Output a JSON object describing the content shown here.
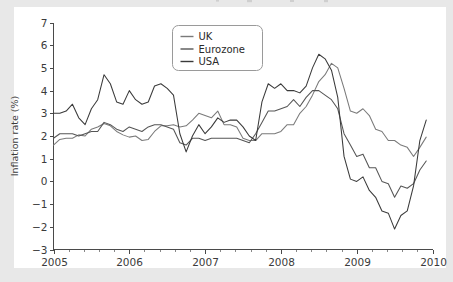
{
  "figure": {
    "background_outer": "#e8e8e8",
    "background_card": "#ffffff",
    "axis_color": "#4a4a4a",
    "text_color": "#3b3b3b"
  },
  "axes": {
    "y_title": "Inflation rate (%)",
    "x_title": "",
    "y_ticks": [
      "7",
      "6",
      "5",
      "4",
      "3",
      "2",
      "1",
      "0",
      "-1",
      "-2",
      "-3"
    ],
    "x_ticks": [
      "2005",
      "2006",
      "2007",
      "2008",
      "2009",
      "2010"
    ]
  },
  "legend": {
    "position": "upper-center",
    "entries": [
      {
        "label": "UK",
        "color": "#7a7a7a"
      },
      {
        "label": "Eurozone",
        "color": "#555555"
      },
      {
        "label": "USA",
        "color": "#3a3a3a"
      }
    ]
  },
  "chart_data": {
    "type": "line",
    "title": "",
    "xlabel": "",
    "ylabel": "Inflation rate (%)",
    "xlim": [
      2005.0,
      2010.0
    ],
    "ylim": [
      -3,
      7
    ],
    "y_ticks": [
      7,
      6,
      5,
      4,
      3,
      2,
      1,
      0,
      -1,
      -2,
      -3
    ],
    "x_ticks": [
      2005,
      2006,
      2007,
      2008,
      2009,
      2010
    ],
    "x_minor_ticks_per_interval": 4,
    "grid": false,
    "legend_position": "upper center",
    "x_unit": "year (monthly samples)",
    "x": [
      2005.0,
      2005.083,
      2005.167,
      2005.25,
      2005.333,
      2005.417,
      2005.5,
      2005.583,
      2005.667,
      2005.75,
      2005.833,
      2005.917,
      2006.0,
      2006.083,
      2006.167,
      2006.25,
      2006.333,
      2006.417,
      2006.5,
      2006.583,
      2006.667,
      2006.75,
      2006.833,
      2006.917,
      2007.0,
      2007.083,
      2007.167,
      2007.25,
      2007.333,
      2007.417,
      2007.5,
      2007.583,
      2007.667,
      2007.75,
      2007.833,
      2007.917,
      2008.0,
      2008.083,
      2008.167,
      2008.25,
      2008.333,
      2008.417,
      2008.5,
      2008.583,
      2008.667,
      2008.75,
      2008.833,
      2008.917,
      2009.0,
      2009.083,
      2009.167,
      2009.25,
      2009.333,
      2009.417,
      2009.5,
      2009.583,
      2009.667,
      2009.75,
      2009.833,
      2009.917
    ],
    "series": [
      {
        "name": "UK",
        "color": "#7a7a7a",
        "values": [
          1.6,
          1.85,
          1.9,
          1.9,
          2.05,
          2.0,
          2.3,
          2.4,
          2.55,
          2.45,
          2.2,
          2.05,
          1.95,
          2.0,
          1.8,
          1.85,
          2.2,
          2.45,
          2.45,
          2.5,
          2.4,
          2.45,
          2.7,
          3.0,
          2.9,
          2.8,
          3.1,
          2.5,
          2.5,
          2.4,
          1.9,
          1.8,
          1.8,
          2.1,
          2.1,
          2.1,
          2.2,
          2.5,
          2.5,
          3.0,
          3.3,
          3.8,
          4.4,
          4.7,
          5.2,
          5.0,
          4.1,
          3.1,
          3.0,
          3.2,
          2.9,
          2.3,
          2.2,
          1.8,
          1.8,
          1.6,
          1.5,
          1.1,
          1.5,
          1.95
        ]
      },
      {
        "name": "Eurozone",
        "color": "#555555",
        "values": [
          1.9,
          2.1,
          2.1,
          2.1,
          2.0,
          2.1,
          2.2,
          2.2,
          2.6,
          2.5,
          2.3,
          2.2,
          2.4,
          2.3,
          2.2,
          2.4,
          2.5,
          2.5,
          2.4,
          2.3,
          1.7,
          1.6,
          1.9,
          1.9,
          1.8,
          1.9,
          1.9,
          1.9,
          1.9,
          1.9,
          1.8,
          1.7,
          2.1,
          2.6,
          3.1,
          3.1,
          3.2,
          3.3,
          3.6,
          3.3,
          3.7,
          4.0,
          4.0,
          3.8,
          3.6,
          3.2,
          2.1,
          1.6,
          1.1,
          1.2,
          0.6,
          0.6,
          0.0,
          -0.1,
          -0.7,
          -0.2,
          -0.3,
          -0.1,
          0.5,
          0.9
        ]
      },
      {
        "name": "USA",
        "color": "#3a3a3a",
        "values": [
          3.0,
          3.0,
          3.1,
          3.4,
          2.8,
          2.5,
          3.2,
          3.6,
          4.7,
          4.3,
          3.5,
          3.4,
          4.0,
          3.6,
          3.4,
          3.5,
          4.2,
          4.3,
          4.1,
          3.8,
          2.1,
          1.3,
          2.0,
          2.5,
          2.1,
          2.4,
          2.8,
          2.6,
          2.7,
          2.7,
          2.4,
          2.0,
          1.8,
          3.5,
          4.3,
          4.1,
          4.3,
          4.0,
          4.0,
          3.9,
          4.2,
          5.0,
          5.6,
          5.4,
          4.9,
          3.7,
          1.1,
          0.1,
          0.0,
          0.2,
          -0.4,
          -0.7,
          -1.3,
          -1.4,
          -2.1,
          -1.5,
          -1.3,
          -0.2,
          1.8,
          2.7
        ]
      }
    ]
  }
}
